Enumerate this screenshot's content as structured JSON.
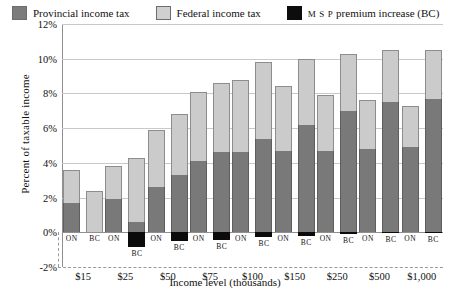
{
  "chart_data": {
    "type": "bar",
    "title": "",
    "subtitle": "",
    "xlabel": "Income level (thousands)",
    "ylabel": "Percent of taxable income",
    "ylim": [
      -2,
      12
    ],
    "yticks": [
      "-2%",
      "0%",
      "2%",
      "4%",
      "6%",
      "8%",
      "10%",
      "12%"
    ],
    "ytick_values": [
      -2,
      0,
      2,
      4,
      6,
      8,
      10,
      12
    ],
    "grid": true,
    "stacked": true,
    "legend_position": "top-inside",
    "legend": [
      {
        "label": "Provincial income tax",
        "color": "#797979",
        "key": "provincial"
      },
      {
        "label": "Federal income tax",
        "color": "#cbcbcb",
        "key": "federal"
      },
      {
        "label": "MSP premium increase (BC)",
        "color": "#0b0b0b",
        "key": "msp"
      }
    ],
    "categories": [
      "$15",
      "$25",
      "$50",
      "$75",
      "$100",
      "$150",
      "$250",
      "$500",
      "$1,000"
    ],
    "subcategories": [
      "ON",
      "BC"
    ],
    "units": "percent of taxable income",
    "series": [
      {
        "name": "Provincial income tax",
        "key": "provincial",
        "color": "#797979",
        "ON": [
          1.7,
          1.9,
          2.6,
          4.1,
          4.6,
          4.7,
          4.7,
          4.8,
          4.9
        ],
        "BC": [
          0.0,
          0.6,
          3.3,
          4.6,
          5.4,
          6.2,
          7.0,
          7.5,
          7.7
        ]
      },
      {
        "name": "Federal income tax",
        "key": "federal",
        "color": "#cbcbcb",
        "ON": [
          1.9,
          1.9,
          3.3,
          4.0,
          4.2,
          3.7,
          3.2,
          2.8,
          2.4
        ],
        "BC": [
          2.4,
          3.7,
          3.5,
          4.0,
          4.4,
          3.8,
          3.3,
          3.0,
          2.8
        ]
      },
      {
        "name": "MSP premium increase (BC)",
        "key": "msp",
        "color": "#0b0b0b",
        "ON": [
          0.0,
          0.0,
          0.0,
          0.0,
          0.0,
          0.0,
          0.0,
          0.0,
          0.0
        ],
        "BC": [
          0.0,
          -0.85,
          -0.5,
          -0.45,
          -0.25,
          -0.2,
          -0.1,
          -0.05,
          -0.03
        ]
      }
    ],
    "totals": {
      "ON": [
        3.6,
        3.8,
        5.9,
        8.1,
        8.8,
        8.4,
        7.9,
        7.6,
        7.3
      ],
      "BC": [
        2.4,
        4.3,
        6.8,
        8.6,
        9.8,
        10.0,
        10.3,
        10.5,
        10.5
      ]
    }
  },
  "axis": {
    "y_title": "Percent of taxable income",
    "x_title": "Income level (thousands)"
  }
}
